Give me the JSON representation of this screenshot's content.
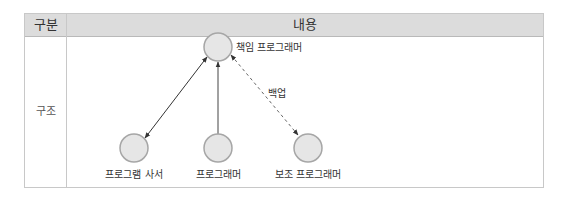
{
  "table": {
    "headers": [
      "구분",
      "내용"
    ],
    "row_label": "구조"
  },
  "diagram": {
    "nodes": [
      {
        "id": "chief",
        "label": "책임 프로그래머"
      },
      {
        "id": "librarian",
        "label": "프로그램 사서"
      },
      {
        "id": "programmer",
        "label": "프로그래머"
      },
      {
        "id": "backup",
        "label": "보조 프로그래머"
      }
    ],
    "edges": [
      {
        "from": "chief",
        "to": "librarian",
        "style": "solid",
        "direction": "both",
        "label": ""
      },
      {
        "from": "programmer",
        "to": "chief",
        "style": "solid",
        "direction": "forward",
        "label": ""
      },
      {
        "from": "chief",
        "to": "backup",
        "style": "dashed",
        "direction": "both",
        "label": "백업"
      }
    ],
    "colors": {
      "node_fill": "#e6e6e6",
      "node_stroke": "#a6a6a6",
      "edge": "#333333",
      "header_bg": "#dcdcdc"
    }
  }
}
